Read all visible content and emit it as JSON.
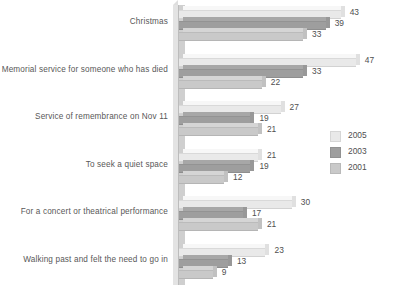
{
  "chart_data": {
    "type": "bar",
    "orientation": "horizontal",
    "title": "",
    "subtitle": "",
    "xlabel": "",
    "ylabel": "",
    "grid": false,
    "legend_position": "right",
    "xlim": [
      0,
      50
    ],
    "categories": [
      "Christmas",
      "Memorial service for someone who has died",
      "Service of remembrance on Nov 11",
      "To seek a quiet space",
      "For a concert or theatrical performance",
      "Walking past and felt the need to go in"
    ],
    "series": [
      {
        "name": "2005",
        "color": "#e9e9e9",
        "values": [
          43,
          47,
          27,
          21,
          30,
          23
        ]
      },
      {
        "name": "2003",
        "color": "#9e9e9e",
        "values": [
          39,
          33,
          19,
          19,
          17,
          13
        ]
      },
      {
        "name": "2001",
        "color": "#c9c9c9",
        "values": [
          33,
          22,
          21,
          12,
          21,
          9
        ]
      }
    ],
    "value_labels": [
      [
        "43",
        "39",
        "33"
      ],
      [
        "47",
        "33",
        "22"
      ],
      [
        "27",
        "19",
        "21"
      ],
      [
        "21",
        "19",
        "12"
      ],
      [
        "30",
        "17",
        "21"
      ],
      [
        "23",
        "13",
        "9"
      ]
    ]
  },
  "legend": {
    "items": [
      {
        "label": "2005",
        "color": "#e9e9e9"
      },
      {
        "label": "2003",
        "color": "#9e9e9e"
      },
      {
        "label": "2001",
        "color": "#c9c9c9"
      }
    ]
  },
  "axis": {
    "wall_color": "#cfcfcf"
  }
}
